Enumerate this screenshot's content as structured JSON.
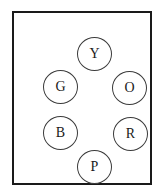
{
  "diagram": {
    "frame": {
      "shape": "rectangle",
      "border_color": "#1a1a1a"
    },
    "circle_border_color": "#3a3a3a",
    "background_color": "#ffffff",
    "nodes": [
      {
        "id": "y",
        "label": "Y",
        "meaning": "Yellow",
        "position": "top"
      },
      {
        "id": "g",
        "label": "G",
        "meaning": "Green",
        "position": "upper-left"
      },
      {
        "id": "o",
        "label": "O",
        "meaning": "Orange",
        "position": "upper-right"
      },
      {
        "id": "b",
        "label": "B",
        "meaning": "Blue",
        "position": "lower-left"
      },
      {
        "id": "r",
        "label": "R",
        "meaning": "Red",
        "position": "lower-right"
      },
      {
        "id": "p",
        "label": "P",
        "meaning": "Purple",
        "position": "bottom"
      }
    ]
  }
}
